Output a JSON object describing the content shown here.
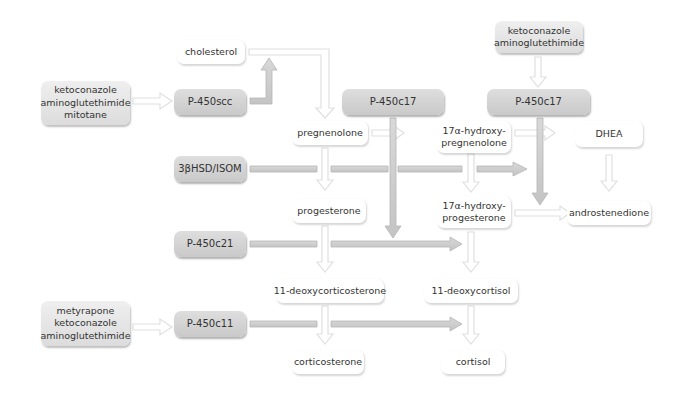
{
  "inhibitors": {
    "scc": [
      "ketoconazole",
      "aminoglutethimide",
      "mitotane"
    ],
    "c17": [
      "ketoconazole",
      "aminoglutethimide"
    ],
    "c11": [
      "metyrapone",
      "ketoconazole",
      "aminoglutethimide"
    ]
  },
  "enzymes": {
    "p450scc": "P-450scc",
    "p450c17_a": "P-450c17",
    "p450c17_b": "P-450c17",
    "hsd": "3βHSD/ISOM",
    "p450c21": "P-450c21",
    "p450c11": "P-450c11"
  },
  "steroids": {
    "cholesterol": "cholesterol",
    "pregnenolone": "pregnenolone",
    "hydroxypregnenolone": [
      "17α-hydroxy-",
      "pregnenolone"
    ],
    "dhea": "DHEA",
    "progesterone": "progesterone",
    "hydroxyprogesterone": [
      "17α-hydroxy-",
      "progesterone"
    ],
    "androstenedione": "androstenedione",
    "deoxycorticosterone": "11-deoxycorticosterone",
    "deoxycortisol": "11-deoxycortisol",
    "corticosterone": "corticosterone",
    "cortisol": "cortisol"
  },
  "colors": {
    "enzyme_fill": "#d3d3d3",
    "inhibitor_fill": "#e6e6e6",
    "arrow_gray": "#c8c8c8",
    "arrow_light": "#e4e4e4",
    "text": "#333333"
  }
}
